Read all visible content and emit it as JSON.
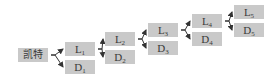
{
  "diagram": {
    "type": "binary-chain-tree",
    "colors": {
      "node_fill": "#c9c9c9",
      "text": "#3a3a3a",
      "arrow": "#333333"
    },
    "root": {
      "label": "凯特",
      "x": 18,
      "y": 48
    },
    "levels": [
      {
        "L": {
          "base": "L",
          "sub": "1",
          "x": 65,
          "y": 42
        },
        "D": {
          "base": "D",
          "sub": "1",
          "x": 65,
          "y": 60
        }
      },
      {
        "L": {
          "base": "L",
          "sub": "2",
          "x": 105,
          "y": 32
        },
        "D": {
          "base": "D",
          "sub": "2",
          "x": 105,
          "y": 50
        }
      },
      {
        "L": {
          "base": "L",
          "sub": "3",
          "x": 148,
          "y": 23
        },
        "D": {
          "base": "D",
          "sub": "3",
          "x": 148,
          "y": 41
        }
      },
      {
        "L": {
          "base": "L",
          "sub": "4",
          "x": 192,
          "y": 14
        },
        "D": {
          "base": "D",
          "sub": "4",
          "x": 192,
          "y": 32
        }
      },
      {
        "L": {
          "base": "L",
          "sub": "5",
          "x": 234,
          "y": 5
        },
        "D": {
          "base": "D",
          "sub": "5",
          "x": 234,
          "y": 23
        }
      }
    ],
    "edges": [
      {
        "from": "root",
        "to": "L1"
      },
      {
        "from": "root",
        "to": "D1"
      },
      {
        "from": "L1",
        "to": "L2"
      },
      {
        "from": "L1",
        "to": "D2"
      },
      {
        "from": "L2",
        "to": "L3"
      },
      {
        "from": "L2",
        "to": "D3"
      },
      {
        "from": "L3",
        "to": "L4"
      },
      {
        "from": "L3",
        "to": "D4"
      },
      {
        "from": "L4",
        "to": "L5"
      },
      {
        "from": "L4",
        "to": "D5"
      }
    ]
  }
}
